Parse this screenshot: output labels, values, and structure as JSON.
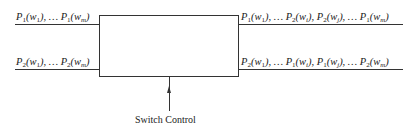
{
  "diagram": {
    "type": "switch-block",
    "inputs": [
      {
        "label_terms": [
          [
            "P",
            "1",
            "w",
            "1"
          ],
          [
            "P",
            "1",
            "w",
            "m"
          ]
        ],
        "text": "P1(w1), ... P1(wm)"
      },
      {
        "label_terms": [
          [
            "P",
            "2",
            "w",
            "1"
          ],
          [
            "P",
            "2",
            "w",
            "m"
          ]
        ],
        "text": "P2(w1), ... P2(wm)"
      }
    ],
    "outputs": [
      {
        "text": "P1(w1), ... P2(wi), P2(wj), ... P1(wm)"
      },
      {
        "text": "P2(w1), ... P1(wi), P1(wj), ... P2(wm)"
      }
    ],
    "control_label": "Switch Control"
  }
}
